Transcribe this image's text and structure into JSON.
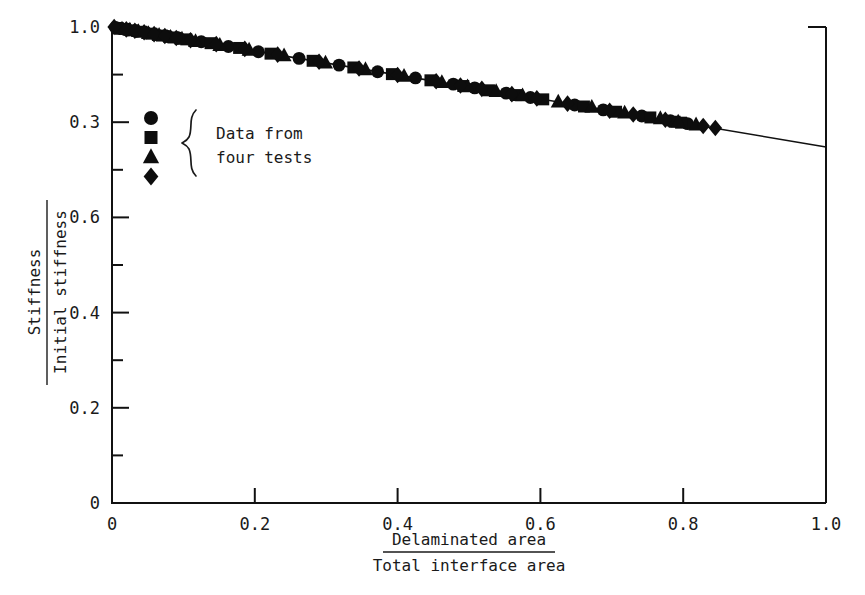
{
  "figure": {
    "background_color": "#ffffff",
    "ink_color": "#111111"
  },
  "chart_data": {
    "type": "scatter",
    "title": "",
    "xlabel_numerator": "Delaminated area",
    "xlabel_denominator": "Total interface area",
    "ylabel_numerator": "Stiffness",
    "ylabel_denominator": "Initial stiffness",
    "xlim": [
      0,
      1.0
    ],
    "ylim": [
      0,
      1.0
    ],
    "grid": false,
    "x_ticks": [
      0,
      0.2,
      0.4,
      0.6,
      0.8,
      1.0
    ],
    "x_tick_labels": [
      "0",
      "0.2",
      "0.4",
      "0.6",
      "0.8",
      "1.0"
    ],
    "y_ticks": [
      0,
      0.2,
      0.4,
      0.6,
      0.8,
      1.0
    ],
    "y_tick_labels": [
      "0",
      "0.2",
      "0.4",
      "0.6",
      "0.3",
      "1.0"
    ],
    "y_minor_ticks": [
      0.1,
      0.3,
      0.5,
      0.7,
      0.9
    ],
    "fit_line": {
      "name": "linear fit",
      "x": [
        0.0,
        1.0
      ],
      "y": [
        1.0,
        0.748
      ]
    },
    "series": [
      {
        "name": "test 1",
        "marker": "circle",
        "color": "#0d0d0d",
        "x": [
          0.005,
          0.012,
          0.022,
          0.034,
          0.048,
          0.062,
          0.079,
          0.093,
          0.125,
          0.163,
          0.205,
          0.262,
          0.318,
          0.372,
          0.425,
          0.478,
          0.508,
          0.552,
          0.586,
          0.648,
          0.688,
          0.742,
          0.782,
          0.806
        ],
        "y": [
          0.999,
          0.997,
          0.994,
          0.991,
          0.988,
          0.984,
          0.98,
          0.977,
          0.969,
          0.959,
          0.948,
          0.934,
          0.92,
          0.906,
          0.893,
          0.88,
          0.872,
          0.861,
          0.852,
          0.836,
          0.826,
          0.813,
          0.803,
          0.797
        ]
      },
      {
        "name": "test 2",
        "marker": "square",
        "color": "#0d0d0d",
        "x": [
          0.008,
          0.018,
          0.029,
          0.041,
          0.055,
          0.07,
          0.086,
          0.104,
          0.138,
          0.178,
          0.222,
          0.281,
          0.338,
          0.392,
          0.446,
          0.492,
          0.528,
          0.566,
          0.604,
          0.661,
          0.706,
          0.754,
          0.788,
          0.797
        ],
        "y": [
          0.998,
          0.996,
          0.993,
          0.99,
          0.986,
          0.982,
          0.978,
          0.974,
          0.966,
          0.956,
          0.944,
          0.929,
          0.915,
          0.901,
          0.888,
          0.876,
          0.867,
          0.857,
          0.848,
          0.833,
          0.822,
          0.81,
          0.801,
          0.799
        ]
      },
      {
        "name": "test 3",
        "marker": "triangle",
        "color": "#0d0d0d",
        "x": [
          0.014,
          0.025,
          0.037,
          0.051,
          0.066,
          0.082,
          0.098,
          0.117,
          0.151,
          0.192,
          0.241,
          0.299,
          0.355,
          0.409,
          0.462,
          0.498,
          0.538,
          0.575,
          0.625,
          0.672,
          0.718,
          0.768,
          0.793,
          0.818
        ],
        "y": [
          0.996,
          0.994,
          0.991,
          0.987,
          0.983,
          0.979,
          0.975,
          0.97,
          0.962,
          0.952,
          0.94,
          0.925,
          0.911,
          0.897,
          0.884,
          0.875,
          0.865,
          0.856,
          0.843,
          0.832,
          0.82,
          0.808,
          0.801,
          0.795
        ]
      },
      {
        "name": "test 4",
        "marker": "diamond",
        "color": "#0d0d0d",
        "x": [
          0.003,
          0.02,
          0.032,
          0.045,
          0.059,
          0.074,
          0.09,
          0.11,
          0.146,
          0.186,
          0.232,
          0.29,
          0.346,
          0.4,
          0.454,
          0.488,
          0.518,
          0.56,
          0.595,
          0.638,
          0.697,
          0.73,
          0.775,
          0.828,
          0.845
        ],
        "y": [
          1.0,
          0.995,
          0.992,
          0.989,
          0.985,
          0.981,
          0.977,
          0.972,
          0.964,
          0.954,
          0.942,
          0.927,
          0.913,
          0.899,
          0.886,
          0.877,
          0.87,
          0.859,
          0.85,
          0.839,
          0.824,
          0.816,
          0.805,
          0.792,
          0.788
        ]
      }
    ]
  },
  "legend": {
    "markers": [
      "circle",
      "square",
      "triangle",
      "diamond"
    ],
    "line1": "Data from",
    "line2": "four tests"
  }
}
